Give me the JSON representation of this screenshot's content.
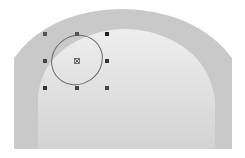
{
  "canvas": {
    "background": "#ffffff",
    "arch": {
      "outer_color": "#c8c8c8",
      "inner_top_color": "#ececec",
      "inner_bottom_color": "#d2d2d2"
    },
    "selection": {
      "shape": "ellipse",
      "stroke_color": "#6a6a6a",
      "handle_color": "#333333",
      "handle_count": 8,
      "center_marker": "x-in-square"
    }
  }
}
